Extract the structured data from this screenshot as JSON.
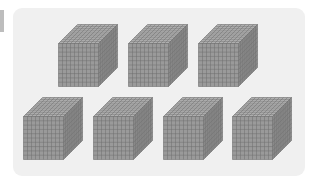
{
  "diagram": {
    "title": "",
    "grid_divisions": 10,
    "colors": {
      "panel": "#f0f0f0",
      "front_face": "#9a9a9a",
      "top_face": "#b2b2b2",
      "side_face": "#8a8a8a",
      "grid_line": "#6f6f6f"
    },
    "rows": [
      {
        "count": 3,
        "cubes": [
          {
            "x": 58,
            "y": 24
          },
          {
            "x": 128,
            "y": 24
          },
          {
            "x": 198,
            "y": 24
          }
        ]
      },
      {
        "count": 4,
        "cubes": [
          {
            "x": 23,
            "y": 97
          },
          {
            "x": 93,
            "y": 97
          },
          {
            "x": 163,
            "y": 97
          },
          {
            "x": 232,
            "y": 97
          }
        ]
      }
    ],
    "total_cubes": 7,
    "value_each": 1000
  }
}
